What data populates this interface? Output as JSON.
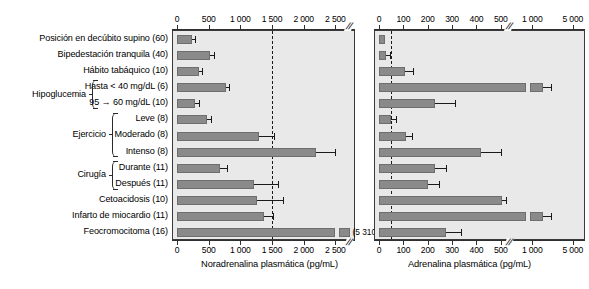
{
  "figure": {
    "type": "grouped-horizontal-bar-figure",
    "panel_count": 2
  },
  "categories": [
    {
      "label": "Posición en decúbito supino (60)",
      "group": null
    },
    {
      "label": "Bipedestación tranquila (40)",
      "group": null
    },
    {
      "label": "Hábito tabáquico (10)",
      "group": null
    },
    {
      "label": "Hasta < 40 mg/dL (6)",
      "group": "Hipoglucemia"
    },
    {
      "label": "95 → 60 mg/dL (10)",
      "group": "Hipoglucemia"
    },
    {
      "label": "Leve (8)",
      "group": "Ejercicio"
    },
    {
      "label": "Moderado (8)",
      "group": "Ejercicio"
    },
    {
      "label": "Intenso (8)",
      "group": "Ejercicio"
    },
    {
      "label": "Durante (11)",
      "group": "Cirugía"
    },
    {
      "label": "Después (11)",
      "group": "Cirugía"
    },
    {
      "label": "Cetoacidosis (10)",
      "group": null
    },
    {
      "label": "Infarto de miocardio (11)",
      "group": null
    },
    {
      "label": "Feocromocitoma (16)",
      "group": null
    }
  ],
  "groups": [
    {
      "name": "Hipoglucemia",
      "first": 3,
      "last": 4
    },
    {
      "name": "Ejercicio",
      "first": 5,
      "last": 7
    },
    {
      "name": "Cirugía",
      "first": 8,
      "last": 9
    }
  ],
  "chart_data": [
    {
      "type": "bar",
      "orientation": "horizontal",
      "title": "",
      "xlabel": "Noradrenalina plasmática (pg/mL)",
      "ylabel": "",
      "xlim": [
        0,
        2800
      ],
      "grid": false,
      "legend": "none",
      "axis_break_after": 2500,
      "threshold_line": 1500,
      "tick_labels": [
        "0",
        "500",
        "1 000",
        "1 500",
        "2 000",
        "2 500"
      ],
      "ticks": [
        0,
        500,
        1000,
        1500,
        2000,
        2500
      ],
      "categories": [
        "Posición en decúbito supino (60)",
        "Bipedestación tranquila (40)",
        "Hábito tabáquico (10)",
        "Hasta < 40 mg/dL (6)",
        "95 → 60 mg/dL (10)",
        "Leve (8)",
        "Moderado (8)",
        "Intenso (8)",
        "Durante (11)",
        "Después (11)",
        "Cetoacidosis (10)",
        "Infarto de miocardio (11)",
        "Feocromocitoma (16)"
      ],
      "values": [
        230,
        520,
        350,
        770,
        280,
        470,
        1290,
        2200,
        680,
        1220,
        1270,
        1380,
        5310
      ],
      "errors_high": [
        290,
        590,
        400,
        820,
        340,
        530,
        1530,
        2630,
        790,
        1590,
        1680,
        1520,
        null
      ],
      "broken_bars": [
        {
          "category": "Feocromocitoma (16)",
          "value": 5310,
          "data_label": "(5 310)"
        }
      ]
    },
    {
      "type": "bar",
      "orientation": "horizontal",
      "title": "",
      "xlabel": "Adrenalina plasmática (pg/mL)",
      "ylabel": "",
      "xlim": [
        0,
        5000
      ],
      "grid": false,
      "legend": "none",
      "axis_break_after": 500,
      "threshold_line": 50,
      "tick_labels": [
        "0",
        "100",
        "200",
        "300",
        "400",
        "500",
        "1 000",
        "5 000"
      ],
      "ticks": [
        0,
        100,
        200,
        300,
        400,
        500,
        1000,
        5000
      ],
      "categories": [
        "Posición en decúbito supino (60)",
        "Bipedestación tranquila (40)",
        "Hábito tabáquico (10)",
        "Hasta < 40 mg/dL (6)",
        "95 → 60 mg/dL (10)",
        "Leve (8)",
        "Moderado (8)",
        "Intenso (8)",
        "Durante (11)",
        "Después (11)",
        "Cetoacidosis (10)",
        "Infarto de miocardio (11)",
        "Feocromocitoma (16)"
      ],
      "values": [
        25,
        30,
        105,
        1000,
        230,
        50,
        110,
        420,
        230,
        200,
        520,
        1000,
        275
      ],
      "errors_high": [
        null,
        45,
        140,
        1150,
        310,
        70,
        135,
        500,
        275,
        245,
        580,
        1100,
        335
      ]
    }
  ]
}
